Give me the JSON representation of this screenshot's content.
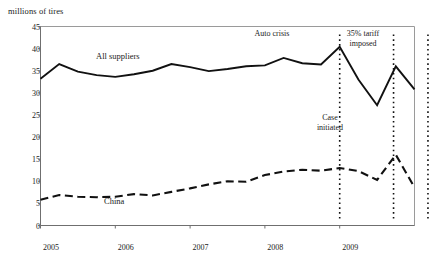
{
  "chart_data": {
    "type": "line",
    "title": "",
    "ylabel": "millions of tires",
    "xlabel": "",
    "ylim": [
      0,
      45
    ],
    "yticks": [
      0,
      5,
      10,
      15,
      20,
      25,
      30,
      35,
      40,
      45
    ],
    "xlim": [
      2005.0,
      2010.0
    ],
    "xticks": [
      2005,
      2006,
      2007,
      2008,
      2009
    ],
    "xtick_labels": [
      "2005",
      "2006",
      "2007",
      "2008",
      "2009"
    ],
    "grid": false,
    "legend_position": "inline-labels",
    "x": [
      2005.0,
      2005.25,
      2005.5,
      2005.75,
      2006.0,
      2006.25,
      2006.5,
      2006.75,
      2007.0,
      2007.25,
      2007.5,
      2007.75,
      2008.0,
      2008.25,
      2008.5,
      2008.75,
      2009.0,
      2009.25,
      2009.5,
      2009.75,
      2010.0
    ],
    "series": [
      {
        "name": "All suppliers",
        "style": "solid",
        "color": "#111111",
        "values": [
          33.2,
          36.5,
          34.8,
          34.0,
          33.6,
          34.2,
          35.0,
          36.5,
          35.8,
          34.9,
          35.4,
          36.0,
          36.2,
          37.9,
          36.7,
          36.4,
          40.4,
          33.0,
          27.2,
          36.0,
          30.8
        ]
      },
      {
        "name": "China",
        "style": "dashed",
        "color": "#111111",
        "values": [
          5.8,
          6.9,
          6.5,
          6.4,
          6.5,
          7.1,
          6.8,
          7.6,
          8.4,
          9.3,
          10.0,
          9.9,
          11.4,
          12.2,
          12.6,
          12.4,
          13.0,
          12.3,
          10.3,
          16.0,
          8.6
        ]
      }
    ],
    "annotations": [
      {
        "label": "Auto crisis",
        "x": 2009.0,
        "kind": "vertical-dotted-line",
        "label_line1": "Auto crisis",
        "label_line2": ""
      },
      {
        "label": "Case initiated",
        "x": 2009.72,
        "kind": "vertical-dotted-line",
        "label_line1": "Case",
        "label_line2": "initiated"
      },
      {
        "label": "35% tariff imposed",
        "x": 2010.18,
        "kind": "vertical-dotted-line",
        "label_line1": "35% tariff",
        "label_line2": "imposed"
      }
    ],
    "series_inline_labels": [
      {
        "text": "All suppliers",
        "series": "All suppliers"
      },
      {
        "text": "China",
        "series": "China"
      }
    ]
  },
  "colors": {
    "line": "#111111",
    "axis": "#888888",
    "plot_border": "#9a9a9a",
    "text": "#1a1a1a",
    "background": "#ffffff"
  }
}
